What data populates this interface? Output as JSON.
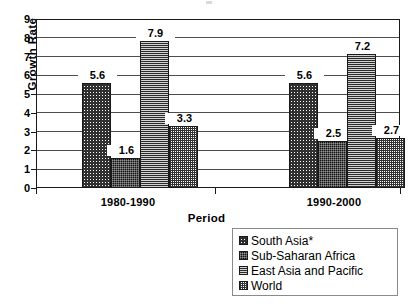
{
  "chart_data": {
    "type": "bar",
    "title": "",
    "xlabel": "Period",
    "ylabel": "Growth Rate",
    "categories": [
      "1980-1990",
      "1990-2000"
    ],
    "ylim": [
      0,
      9
    ],
    "yticks": [
      0,
      1,
      2,
      3,
      4,
      5,
      6,
      7,
      8,
      9
    ],
    "grid": true,
    "legend_position": "bottom-right",
    "series": [
      {
        "name": "South Asia*",
        "values": [
          5.6,
          5.6
        ],
        "pattern": "diagonal-crosshatch",
        "color": "#303030"
      },
      {
        "name": "Sub-Saharan Africa",
        "values": [
          1.6,
          2.5
        ],
        "pattern": "dark-checker",
        "color": "#141414"
      },
      {
        "name": "East Asia and Pacific",
        "values": [
          7.9,
          7.2
        ],
        "pattern": "horizontal-lines",
        "color": "#2b2b2b"
      },
      {
        "name": "World",
        "values": [
          3.3,
          2.7
        ],
        "pattern": "fine-checker",
        "color": "#333333"
      }
    ],
    "data_labels": [
      "5.6",
      "1.6",
      "7.9",
      "3.3",
      "5.6",
      "2.5",
      "7.2",
      "2.7"
    ]
  },
  "axis": {
    "y_title": "Growth Rate",
    "x_title": "Period",
    "y_tick_labels": [
      "9",
      "8",
      "7",
      "6",
      "5",
      "4",
      "3",
      "2",
      "1",
      "0"
    ],
    "x_tick_labels": [
      "1980-1990",
      "1990-2000"
    ]
  },
  "legend": {
    "items": [
      {
        "label": "South Asia*"
      },
      {
        "label": "Sub-Saharan Africa"
      },
      {
        "label": "East Asia and Pacific"
      },
      {
        "label": "World"
      }
    ]
  }
}
